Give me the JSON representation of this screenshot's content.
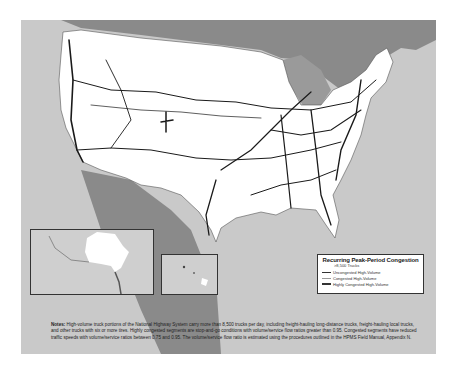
{
  "map": {
    "subject": "High-volume truck portions of the National Highway System - recurring peak-period congestion",
    "insets": [
      {
        "name": "Alaska"
      },
      {
        "name": "Hawaii"
      }
    ]
  },
  "legend": {
    "title": "Recurring Peak-Period Congestion",
    "subtitle": ">8,500 Trucks",
    "items": [
      {
        "label": "Uncongested High-Volume",
        "style": "thin"
      },
      {
        "label": "Congested High-Volume",
        "style": "light"
      },
      {
        "label": "Highly Congested High-Volume",
        "style": "thick"
      }
    ]
  },
  "notes": {
    "label": "Notes:",
    "text": "High-volume truck portions of the National Highway System carry more than 8,500 trucks per day, including freight-hauling long-distance trucks, freight-hauling local trucks, and other trucks with six or more tires.  Highly congested segments are stop-and-go conditions with volume/service flow ratios greater than 0.95.  Congested segments have reduced traffic speeds with volume/service ratios between 0.75 and 0.95.  The volume/service flow ratio is estimated using the procedures outlined in the HPMS Field Manual, Appendix N."
  },
  "colors": {
    "ocean": "#c9c9c9",
    "land": "#ffffff",
    "canada_mexico": "#8a8a8a",
    "highway": "#1a1a1a"
  }
}
